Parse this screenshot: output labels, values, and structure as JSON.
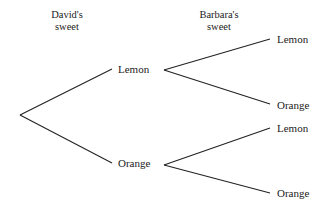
{
  "headers": {
    "david": {
      "line1": "David's",
      "line2": "sweet"
    },
    "barbara": {
      "line1": "Barbara's",
      "line2": "sweet"
    }
  },
  "tree": {
    "first": [
      {
        "label": "Lemon",
        "second": [
          {
            "label": "Lemon"
          },
          {
            "label": "Orange"
          }
        ]
      },
      {
        "label": "Orange",
        "second": [
          {
            "label": "Lemon"
          },
          {
            "label": "Orange"
          }
        ]
      }
    ]
  },
  "colors": {
    "line": "#222222",
    "text": "#222222",
    "background": "#ffffff"
  }
}
